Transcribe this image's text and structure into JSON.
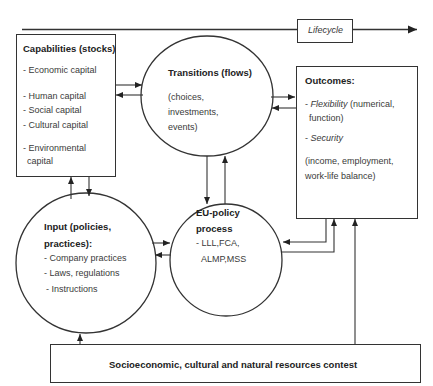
{
  "lifecycle": {
    "label": "Lifecycle"
  },
  "capabilities": {
    "title": "Capabilities (stocks)",
    "items": [
      "- Economic capital",
      "- Human capital",
      "- Social capital",
      "- Cultural capital",
      "- Environmental",
      "capital"
    ]
  },
  "transitions": {
    "title": "Transitions (flows)",
    "lines": [
      "(choices,",
      "investments,",
      "events)"
    ]
  },
  "outcomes": {
    "title": "Outcomes:",
    "flex_dash": "- ",
    "flex_label": "Flexibility",
    "flex_detail": " (numerical,",
    "flex_detail2": "function)",
    "sec_dash": "- ",
    "sec_label": "Security",
    "sec_detail": [
      "(income, employment,",
      "work-life balance)"
    ]
  },
  "input": {
    "title": [
      "Input (policies,",
      "practices):"
    ],
    "items": [
      "- Company practices",
      "- Laws, regulations",
      "- Instructions"
    ]
  },
  "eu_policy": {
    "title": [
      "EU-policy",
      "process"
    ],
    "items": [
      "- LLL,FCA,",
      "ALMP,MSS"
    ]
  },
  "context": {
    "label": "Socioeconomic, cultural and natural resources contest"
  },
  "colors": {
    "stroke": "#333333",
    "text": "#3a3a3a",
    "background": "#ffffff"
  }
}
